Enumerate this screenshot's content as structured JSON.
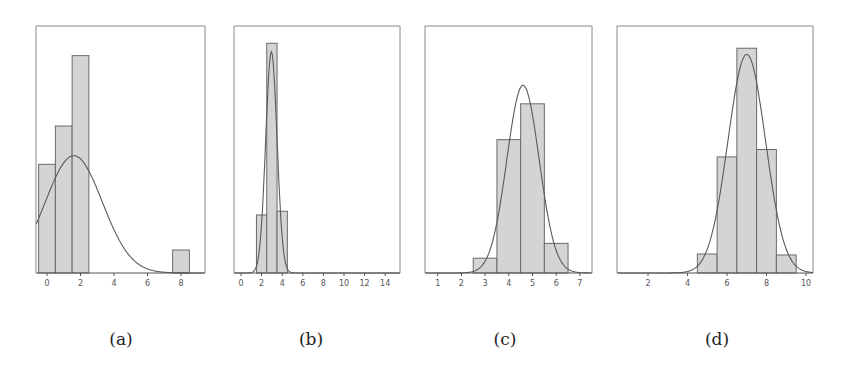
{
  "chart_data": [
    {
      "id": "a",
      "caption": "(a)",
      "type": "bar",
      "subtype": "histogram_with_normal_fit",
      "title": "",
      "xlabel": "",
      "ylabel": "",
      "grid": false,
      "frame": {
        "left": 36,
        "right": 205,
        "top": 26,
        "bottom": 273
      },
      "x_axis": {
        "px0": 47,
        "px_per_unit": 16.75,
        "xlim": [
          -0.65,
          9.45
        ]
      },
      "ymax_rel": 1.0,
      "ticks": [
        0,
        2,
        4,
        6,
        8
      ],
      "tick_labels": [
        "0",
        "2",
        "4",
        "6",
        "8"
      ],
      "bins": [
        {
          "x0": -0.5,
          "x1": 0.5,
          "height": 0.44
        },
        {
          "x0": 0.5,
          "x1": 1.5,
          "height": 0.595
        },
        {
          "x0": 1.5,
          "x1": 2.5,
          "height": 0.88
        },
        {
          "x0": 7.5,
          "x1": 8.5,
          "height": 0.093
        }
      ],
      "curve": {
        "mean": 1.6,
        "sd": 1.7,
        "peak": 0.475
      }
    },
    {
      "id": "b",
      "caption": "(b)",
      "type": "bar",
      "subtype": "histogram_with_normal_fit",
      "title": "",
      "xlabel": "",
      "ylabel": "",
      "grid": false,
      "frame": {
        "left": 234,
        "right": 400,
        "top": 26,
        "bottom": 273
      },
      "x_axis": {
        "px0": 241,
        "px_per_unit": 10.3,
        "xlim": [
          -0.7,
          15.5
        ]
      },
      "ymax_rel": 1.0,
      "ticks": [
        0,
        2,
        4,
        6,
        8,
        10,
        12,
        14
      ],
      "tick_labels": [
        "0",
        "2",
        "4",
        "6",
        "8",
        "10",
        "12",
        "14"
      ],
      "bins": [
        {
          "x0": 1.5,
          "x1": 2.5,
          "height": 0.235
        },
        {
          "x0": 2.5,
          "x1": 3.5,
          "height": 0.93
        },
        {
          "x0": 3.5,
          "x1": 4.5,
          "height": 0.25
        }
      ],
      "curve": {
        "mean": 2.95,
        "sd": 0.55,
        "peak": 0.895
      }
    },
    {
      "id": "c",
      "caption": "(c)",
      "type": "bar",
      "subtype": "histogram_with_normal_fit",
      "title": "",
      "xlabel": "",
      "ylabel": "",
      "grid": false,
      "frame": {
        "left": 425,
        "right": 592,
        "top": 26,
        "bottom": 273
      },
      "x_axis": {
        "px0": 414,
        "px_per_unit": 23.7,
        "xlim": [
          0.46,
          7.55
        ]
      },
      "ymax_rel": 1.0,
      "ticks": [
        1,
        2,
        3,
        4,
        5,
        6,
        7
      ],
      "tick_labels": [
        "1",
        "2",
        "3",
        "4",
        "5",
        "6",
        "7"
      ],
      "bins": [
        {
          "x0": 2.5,
          "x1": 3.5,
          "height": 0.06
        },
        {
          "x0": 3.5,
          "x1": 4.5,
          "height": 0.54
        },
        {
          "x0": 4.5,
          "x1": 5.5,
          "height": 0.685
        },
        {
          "x0": 5.5,
          "x1": 6.5,
          "height": 0.12
        }
      ],
      "curve": {
        "mean": 4.6,
        "sd": 0.68,
        "peak": 0.76
      }
    },
    {
      "id": "d",
      "caption": "(d)",
      "type": "bar",
      "subtype": "histogram_with_normal_fit",
      "title": "",
      "xlabel": "",
      "ylabel": "",
      "grid": false,
      "frame": {
        "left": 617,
        "right": 813,
        "top": 26,
        "bottom": 273
      },
      "x_axis": {
        "px0": 608.5,
        "px_per_unit": 19.75,
        "xlim": [
          0.43,
          10.35
        ]
      },
      "ymax_rel": 1.0,
      "ticks": [
        2,
        4,
        6,
        8,
        10
      ],
      "tick_labels": [
        "2",
        "4",
        "6",
        "8",
        "10"
      ],
      "bins": [
        {
          "x0": 4.5,
          "x1": 5.5,
          "height": 0.077
        },
        {
          "x0": 5.5,
          "x1": 6.5,
          "height": 0.47
        },
        {
          "x0": 6.5,
          "x1": 7.5,
          "height": 0.91
        },
        {
          "x0": 7.5,
          "x1": 8.5,
          "height": 0.5
        },
        {
          "x0": 8.5,
          "x1": 9.5,
          "height": 0.073
        }
      ],
      "curve": {
        "mean": 7.0,
        "sd": 0.95,
        "peak": 0.885
      }
    }
  ],
  "style": {
    "bar_fill": "#d4d4d4",
    "bar_stroke": "#6a6a6a",
    "curve_stroke": "#5a5a5a",
    "frame_stroke": "#8a8a8a",
    "axis_stroke": "#555555"
  },
  "captions": [
    "(a)",
    "(b)",
    "(c)",
    "(d)"
  ]
}
